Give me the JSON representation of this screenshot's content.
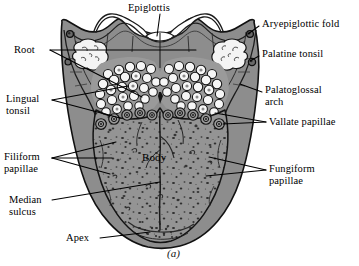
{
  "figure": {
    "caption": "(a)",
    "colors": {
      "body_gray": "#949494",
      "arch_gray": "#8d8d8d",
      "outline": "#1a1a1a",
      "tonsil_white": "#f2f2f2",
      "background": "#ffffff",
      "speckle": "#2b2b2b"
    }
  },
  "labels": {
    "epiglottis": "Epiglottis",
    "aryepiglottic_fold": "Aryepiglottic fold",
    "palatine_tonsil": "Palatine tonsil",
    "palatoglossal_arch": "Palatoglossal\narch",
    "vallate_papillae": "Vallate papillae",
    "fungiform_papillae": "Fungiform\npapillae",
    "root": "Root",
    "lingual_tonsil": "Lingual\ntonsil",
    "filiform_papillae": "Filiform\npapillae",
    "median_sulcus": "Median\nsulcus",
    "apex": "Apex",
    "body": "Body"
  },
  "structures": [
    {
      "name": "epiglottis",
      "side": "top-center",
      "description": "scalloped white folds at superior margin"
    },
    {
      "name": "aryepiglottic-fold",
      "side": "upper-right",
      "description": "fold running to corner nodule"
    },
    {
      "name": "palatine-tonsil",
      "side": "both-upper",
      "description": "lobulated white masses at lateral corners"
    },
    {
      "name": "palatoglossal-arch",
      "side": "right",
      "description": "lateral gray arch band"
    },
    {
      "name": "lingual-tonsil",
      "side": "center-upper",
      "description": "cobblestone nodules on tongue root"
    },
    {
      "name": "vallate-papillae",
      "side": "center",
      "description": "V-shaped row of concentric ringed papillae"
    },
    {
      "name": "filiform-papillae",
      "side": "left",
      "description": "fine speckles over body"
    },
    {
      "name": "fungiform-papillae",
      "side": "right",
      "description": "rounded speckles over body"
    },
    {
      "name": "median-sulcus",
      "side": "center",
      "description": "vertical midline groove"
    },
    {
      "name": "body",
      "side": "center",
      "description": "anterior two-thirds of tongue"
    },
    {
      "name": "apex",
      "side": "bottom",
      "description": "tip of tongue"
    },
    {
      "name": "root",
      "side": "upper-left",
      "description": "posterior third of tongue"
    }
  ]
}
